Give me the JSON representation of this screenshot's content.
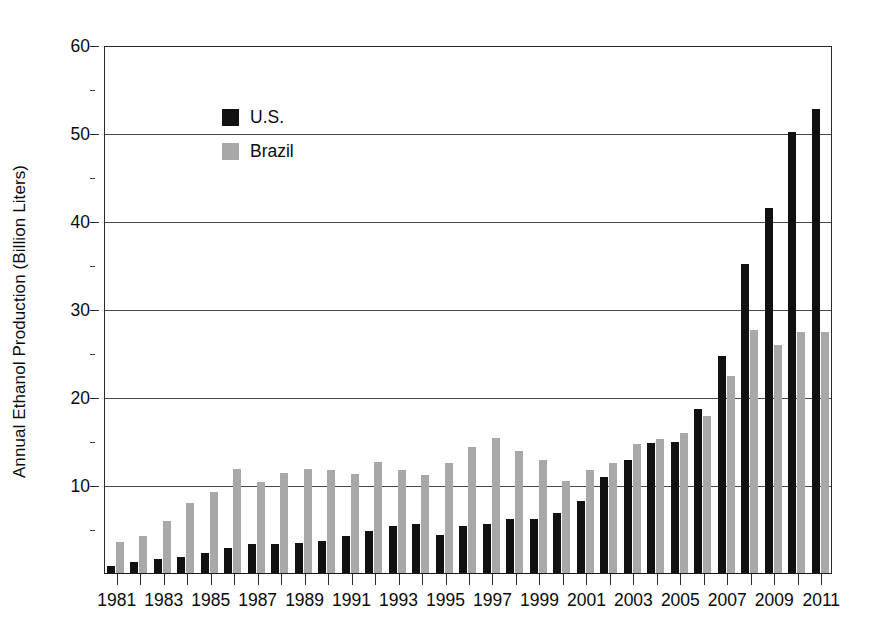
{
  "chart_data": {
    "type": "bar",
    "title": "",
    "subtitle": "",
    "xlabel": "",
    "ylabel": "Annual Ethanol Production (Billion Liters)",
    "ylim": [
      0,
      60
    ],
    "ytick_values": [
      0,
      10,
      20,
      30,
      40,
      50,
      60
    ],
    "ytick_labels": [
      "",
      "10",
      "20",
      "30",
      "40",
      "50",
      "60"
    ],
    "yminor_values": [
      5,
      15,
      25,
      35,
      45,
      55
    ],
    "grid": "horizontal",
    "legend_position": "top-left-inside",
    "categories": [
      "1981",
      "1982",
      "1983",
      "1984",
      "1985",
      "1986",
      "1987",
      "1988",
      "1989",
      "1990",
      "1991",
      "1992",
      "1993",
      "1994",
      "1995",
      "1996",
      "1997",
      "1998",
      "1999",
      "2000",
      "2001",
      "2002",
      "2003",
      "2004",
      "2005",
      "2006",
      "2007",
      "2008",
      "2009",
      "2010",
      "2011"
    ],
    "xtick_labels_shown": [
      "1981",
      "1983",
      "1985",
      "1987",
      "1989",
      "1991",
      "1993",
      "1995",
      "1997",
      "1999",
      "2001",
      "2003",
      "2005",
      "2007",
      "2009",
      "2011"
    ],
    "series": [
      {
        "name": "U.S.",
        "color": "#111111",
        "values": [
          0.9,
          1.4,
          1.7,
          1.9,
          2.4,
          3.0,
          3.4,
          3.4,
          3.5,
          3.8,
          4.3,
          4.9,
          5.4,
          5.7,
          4.4,
          5.5,
          5.7,
          6.2,
          6.3,
          6.9,
          8.3,
          11.0,
          12.9,
          14.9,
          15.0,
          18.7,
          24.8,
          35.2,
          41.6,
          50.2,
          52.8
        ]
      },
      {
        "name": "Brazil",
        "color": "#a8a8a8",
        "values": [
          3.6,
          4.3,
          6.0,
          8.1,
          9.3,
          11.9,
          10.4,
          11.5,
          11.9,
          11.8,
          11.4,
          12.7,
          11.8,
          11.3,
          12.6,
          14.4,
          15.4,
          14.0,
          13.0,
          10.6,
          11.8,
          12.6,
          14.8,
          15.3,
          16.0,
          17.9,
          22.5,
          27.7,
          26.0,
          27.5,
          27.5
        ]
      }
    ]
  },
  "legend": {
    "items": [
      {
        "label": "U.S.",
        "color": "#111111"
      },
      {
        "label": "Brazil",
        "color": "#a8a8a8"
      }
    ]
  }
}
